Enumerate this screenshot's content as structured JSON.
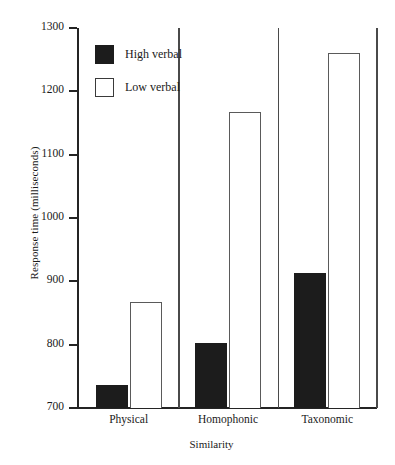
{
  "chart_data": {
    "type": "bar",
    "title": "",
    "xlabel": "Similarity",
    "ylabel": "Response time (milliseconds)",
    "categories": [
      "Physical",
      "Homophonic",
      "Taxonomic"
    ],
    "series": [
      {
        "name": "High verbal",
        "color": "#1c1c1c",
        "fill": "solid",
        "values": [
          736,
          803,
          913
        ]
      },
      {
        "name": "Low verbal",
        "color": "#ffffff",
        "fill": "outline",
        "values": [
          868,
          1168,
          1261
        ]
      }
    ],
    "ylim": [
      700,
      1300
    ],
    "ytick_labels": [
      "1300",
      "1200",
      "1100",
      "1000",
      "900",
      "800",
      "700"
    ],
    "ytick_values": [
      1300,
      1200,
      1100,
      1000,
      900,
      800,
      700
    ],
    "ytick_step": 100,
    "grid": false,
    "legend_position": "upper-left-inside"
  },
  "legend": {
    "entries": [
      {
        "label": "High verbal",
        "swatch": "filled-black-square"
      },
      {
        "label": "Low verbal",
        "swatch": "outlined-white-square"
      }
    ]
  },
  "axes": {
    "y_title": "Response time (milliseconds)",
    "x_title": "Similarity"
  }
}
